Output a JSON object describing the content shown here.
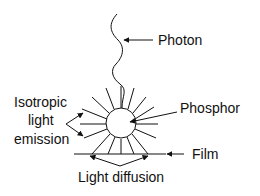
{
  "diagram": {
    "labels": {
      "photon": "Photon",
      "phosphor": "Phosphor",
      "film": "Film",
      "isotropic_1": "Isotropic",
      "isotropic_2": "light",
      "isotropic_3": "emission",
      "diffusion": "Light diffusion"
    },
    "colors": {
      "stroke": "#111111",
      "background": "#ffffff"
    }
  }
}
